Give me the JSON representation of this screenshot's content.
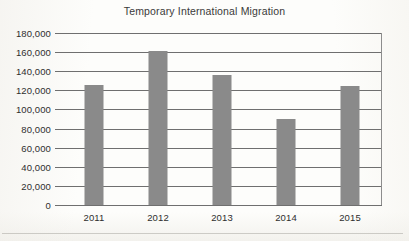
{
  "chart_data": {
    "type": "bar",
    "title": "Temporary International Migration",
    "xlabel": "",
    "ylabel": "",
    "categories": [
      "2011",
      "2012",
      "2013",
      "2014",
      "2015"
    ],
    "values": [
      126000,
      161000,
      136000,
      90000,
      125000
    ],
    "ylim": [
      0,
      180000
    ],
    "ytick_step": 20000,
    "ytick_labels": [
      "180,000",
      "160,000",
      "140,000",
      "120,000",
      "100,000",
      "80,000",
      "60,000",
      "40,000",
      "20,000",
      "0"
    ],
    "ytick_values": [
      180000,
      160000,
      140000,
      120000,
      100000,
      80000,
      60000,
      40000,
      20000,
      0
    ],
    "grid": true,
    "legend": false,
    "bar_color": "#8a8a8a",
    "gridline_color": "#6f6f6f",
    "text_color": "#2e2e2e"
  }
}
